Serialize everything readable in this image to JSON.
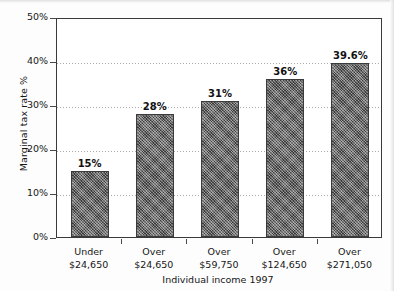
{
  "chart_data": {
    "type": "bar",
    "title": "",
    "subtitle": "",
    "xlabel": "Individual income 1997",
    "ylabel": "Marginal tax rate %",
    "categories": [
      "Under $24,650",
      "Over $24,650",
      "Over $59,750",
      "Over $124,650",
      "Over $271,050"
    ],
    "category_lines": [
      [
        "Under",
        "$24,650"
      ],
      [
        "Over",
        "$24,650"
      ],
      [
        "Over",
        "$59,750"
      ],
      [
        "Over",
        "$124,650"
      ],
      [
        "Over",
        "$271,050"
      ]
    ],
    "values": [
      15,
      28,
      31,
      36,
      39.6
    ],
    "data_labels": [
      "15%",
      "28%",
      "31%",
      "36%",
      "39.6%"
    ],
    "ylim": [
      0,
      50
    ],
    "ytick_values": [
      0,
      10,
      20,
      30,
      40,
      50
    ],
    "ytick_labels": [
      "0%",
      "10%",
      "20%",
      "30%",
      "40%",
      "50%"
    ],
    "grid": true,
    "grid_axis": "y",
    "grid_style": "dotted",
    "legend": false,
    "legend_position": "none",
    "bar_color": "#5d5d5d",
    "bar_edge_color": "#3b3b3b",
    "plot_background": "#ffffff",
    "axis_color": "#3a3a3a",
    "gridline_color": "#a9a9a9",
    "text_color": "#161616"
  },
  "axis": {
    "y_title": "Marginal tax rate %",
    "x_title": "Individual income 1997",
    "y_ticks": [
      {
        "label": "50%",
        "value": 50
      },
      {
        "label": "40%",
        "value": 40
      },
      {
        "label": "30%",
        "value": 30
      },
      {
        "label": "20%",
        "value": 20
      },
      {
        "label": "10%",
        "value": 10
      },
      {
        "label": "0%",
        "value": 0
      }
    ]
  },
  "bars": [
    {
      "label_top": "Under",
      "label_bottom": "$24,650",
      "value_label": "15%",
      "value": 15
    },
    {
      "label_top": "Over",
      "label_bottom": "$24,650",
      "value_label": "28%",
      "value": 28
    },
    {
      "label_top": "Over",
      "label_bottom": "$59,750",
      "value_label": "31%",
      "value": 31
    },
    {
      "label_top": "Over",
      "label_bottom": "$124,650",
      "value_label": "36%",
      "value": 36
    },
    {
      "label_top": "Over",
      "label_bottom": "$271,050",
      "value_label": "39.6%",
      "value": 39.6
    }
  ]
}
